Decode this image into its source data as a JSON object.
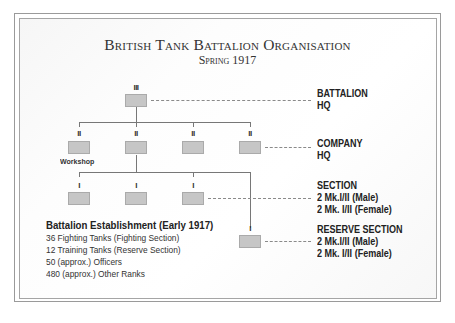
{
  "title": "British Tank Battalion Organisation",
  "subtitle": "Spring 1917",
  "symbols": {
    "battalion": "III",
    "company": "II",
    "section": "I"
  },
  "units": {
    "battalion_hq": {
      "symbol": "III"
    },
    "companies": [
      {
        "symbol": "II",
        "label": "Workshop"
      },
      {
        "symbol": "II",
        "label": ""
      },
      {
        "symbol": "II",
        "label": ""
      },
      {
        "symbol": "II",
        "label": ""
      }
    ],
    "sections": [
      {
        "symbol": "I"
      },
      {
        "symbol": "I"
      },
      {
        "symbol": "I"
      }
    ],
    "reserve_section": {
      "symbol": "I"
    }
  },
  "labels": {
    "battalion_hq": [
      "BATTALION",
      "HQ"
    ],
    "company_hq": [
      "COMPANY",
      "HQ"
    ],
    "section": [
      "SECTION",
      "2 Mk.I/II (Male)",
      "2 Mk. I/II (Female)"
    ],
    "reserve_section": [
      "RESERVE SECTION",
      "2 Mk.I/II (Male)",
      "2 Mk. I/II (Female)"
    ]
  },
  "establishment": {
    "heading": "Battalion Establishment (Early 1917)",
    "lines": [
      "36 Fighting Tanks (Fighting Section)",
      "12 Training Tanks (Reserve Section)",
      "50 (approx.) Officers",
      "480 (approx.) Other Ranks"
    ]
  },
  "colors": {
    "unit_fill": "#c6c6c6",
    "unit_border": "#aaaaaa",
    "line": "#777777",
    "text": "#222222"
  }
}
